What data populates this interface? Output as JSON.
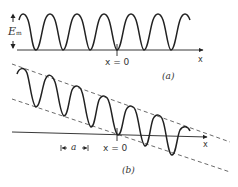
{
  "figure": {
    "panel_a": {
      "caption": "(a)",
      "origin_label": "x = 0",
      "axis_label": "x",
      "amplitude_label": "E",
      "amplitude_subscript": "m"
    },
    "panel_b": {
      "caption": "(b)",
      "origin_label": "x = 0",
      "axis_label": "x",
      "spacing_label": "a"
    },
    "colors": {
      "ink": "#222222",
      "dashed": "#444444",
      "background": "#ffffff"
    }
  }
}
